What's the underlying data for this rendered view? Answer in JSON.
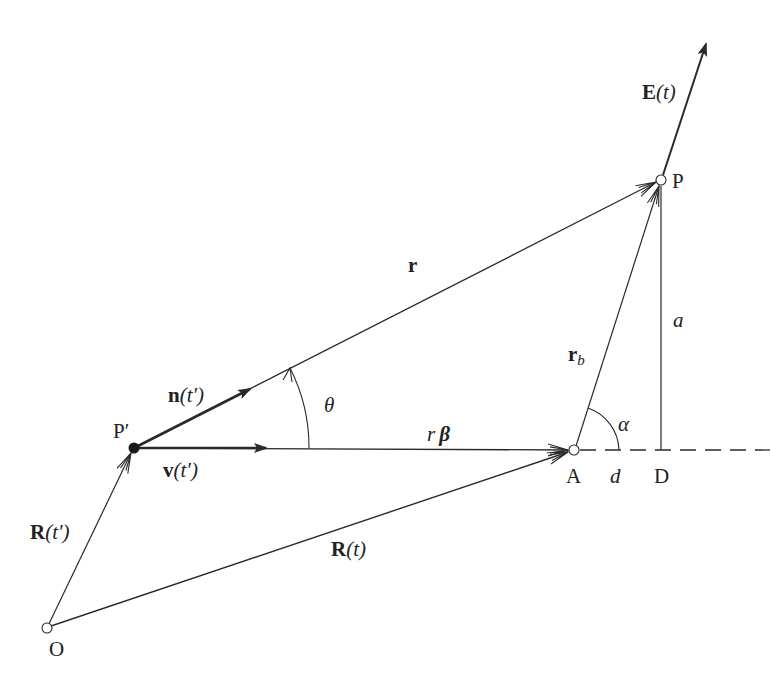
{
  "diagram": {
    "type": "vector geometry diagram",
    "colors": {
      "line": "#2a2a2a",
      "background": "#ffffff"
    },
    "points": {
      "O": {
        "label": "O",
        "x": 47,
        "y": 628,
        "marker": "open-circle"
      },
      "P_prime": {
        "label": "P′",
        "x": 134,
        "y": 448,
        "marker": "filled-dot"
      },
      "A": {
        "label": "A",
        "x": 574,
        "y": 450,
        "marker": "open-circle"
      },
      "P": {
        "label": "P",
        "x": 661,
        "y": 180,
        "marker": "open-circle"
      },
      "D": {
        "label": "D",
        "x": 661,
        "y": 450,
        "marker": "none"
      }
    },
    "vectors": {
      "R_t_prime": {
        "label_main": "R",
        "label_arg": "(t′)",
        "from": "O",
        "to": "P_prime"
      },
      "R_t": {
        "label_main": "R",
        "label_arg": "(t)",
        "from": "O",
        "to": "A"
      },
      "r": {
        "label": "r",
        "from": "P_prime",
        "to": "P"
      },
      "n_t_prime": {
        "label_main": "n",
        "label_arg": "(t′)",
        "along": "r"
      },
      "v_t_prime": {
        "label_main": "v",
        "label_arg": "(t′)",
        "along": "r_beta"
      },
      "r_beta": {
        "label_r": "r",
        "label_beta": "β",
        "from": "P_prime",
        "to": "A"
      },
      "r_b": {
        "label_main": "r",
        "label_sub": "b",
        "from": "A",
        "to": "P"
      },
      "E_t": {
        "label_main": "E",
        "label_arg": "(t)",
        "from": "P",
        "direction": "up-right"
      }
    },
    "segments": {
      "a": {
        "label": "a",
        "from": "D",
        "to": "P"
      },
      "d": {
        "label": "d",
        "from": "A",
        "to": "D"
      },
      "dashed_extension": {
        "from": "A",
        "to_x": 770,
        "style": "dashed"
      }
    },
    "angles": {
      "theta": {
        "label": "θ",
        "between": [
          "r_beta",
          "r"
        ],
        "vertex": "P_prime"
      },
      "alpha": {
        "label": "α",
        "between": [
          "dashed_extension",
          "r_b"
        ],
        "vertex": "A"
      }
    },
    "caption": {
      "text": "",
      "note": "faint, cut-off caption at bottom (illegible)"
    }
  }
}
